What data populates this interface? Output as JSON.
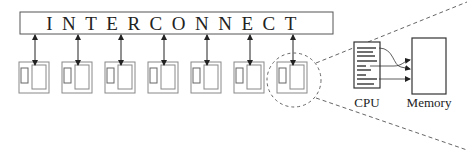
{
  "diagram": {
    "interconnect_label": "INTERCONNECT",
    "node_count": 7,
    "zoomed_node_index": 6,
    "cpu_label": "CPU",
    "memory_label": "Memory",
    "colors": {
      "stroke": "#333333",
      "node_stroke": "#888888",
      "dashed": "#666666"
    }
  }
}
